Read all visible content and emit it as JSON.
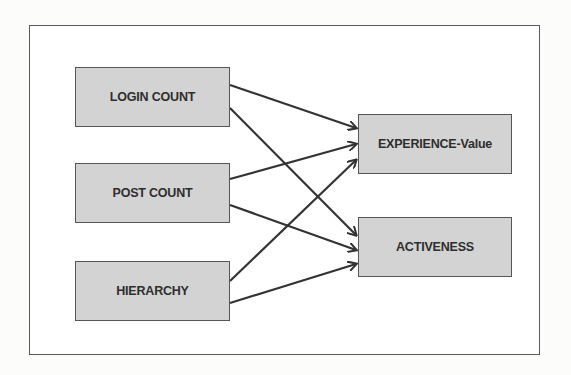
{
  "diagram": {
    "inputs": [
      {
        "id": "login",
        "label": "LOGIN COUNT"
      },
      {
        "id": "post",
        "label": "POST COUNT"
      },
      {
        "id": "hier",
        "label": "HIERARCHY"
      }
    ],
    "outputs": [
      {
        "id": "exp",
        "label": "EXPERIENCE-Value"
      },
      {
        "id": "act",
        "label": "ACTIVENESS"
      }
    ],
    "edges": [
      {
        "from": "login",
        "to": "exp"
      },
      {
        "from": "login",
        "to": "act"
      },
      {
        "from": "post",
        "to": "exp"
      },
      {
        "from": "post",
        "to": "act"
      },
      {
        "from": "hier",
        "to": "exp"
      },
      {
        "from": "hier",
        "to": "act"
      }
    ],
    "colors": {
      "node_fill": "#d3d3d3",
      "node_border": "#555555",
      "arrow": "#333333",
      "text": "#2e2e2e"
    }
  }
}
